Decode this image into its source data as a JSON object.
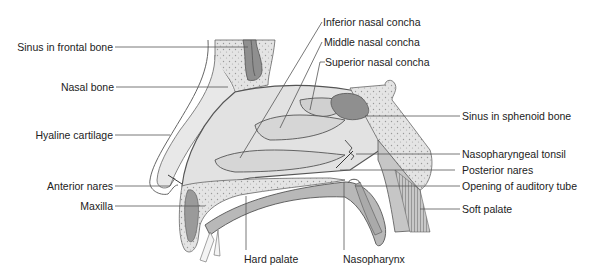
{
  "diagram": {
    "type": "anatomical cross-section",
    "colors": {
      "background": "#ffffff",
      "tissue_light": "#e6e6e6",
      "tissue_mid": "#cfcfcf",
      "bone_stipple": "#dcdcdc",
      "sinus_dark": "#8c8c8c",
      "outline": "#555555",
      "leader_line": "#555555",
      "text": "#222222"
    },
    "labels_left": [
      {
        "id": "sinus-frontal",
        "text": "Sinus in frontal bone"
      },
      {
        "id": "nasal-bone",
        "text": "Nasal bone"
      },
      {
        "id": "hyaline-cartilage",
        "text": "Hyaline cartilage"
      },
      {
        "id": "anterior-nares",
        "text": "Anterior nares"
      },
      {
        "id": "maxilla",
        "text": "Maxilla"
      }
    ],
    "labels_top": [
      {
        "id": "inferior-concha",
        "text": "Inferior nasal concha"
      },
      {
        "id": "middle-concha",
        "text": "Middle nasal concha"
      },
      {
        "id": "superior-concha",
        "text": "Superior nasal concha"
      }
    ],
    "labels_right": [
      {
        "id": "sinus-sphenoid",
        "text": "Sinus in sphenoid bone"
      },
      {
        "id": "nasopharyngeal-tonsil",
        "text": "Nasopharyngeal tonsil"
      },
      {
        "id": "posterior-nares",
        "text": "Posterior nares"
      },
      {
        "id": "auditory-tube",
        "text": "Opening of auditory tube"
      },
      {
        "id": "soft-palate",
        "text": "Soft palate"
      }
    ],
    "labels_bottom": [
      {
        "id": "hard-palate",
        "text": "Hard palate"
      },
      {
        "id": "nasopharynx",
        "text": "Nasopharynx"
      }
    ]
  }
}
